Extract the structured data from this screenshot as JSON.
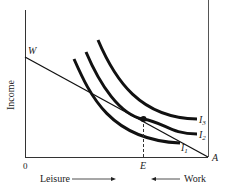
{
  "diagram": {
    "type": "indifference-curves",
    "y_axis_label": "Income",
    "origin_label": "0",
    "budget_intercept_label": "W",
    "right_corner_label": "A",
    "equilibrium_label": "E",
    "x_left_label": "Leisure",
    "x_right_label": "Work",
    "curves": [
      {
        "id": "I1",
        "label": "I",
        "sub": "1"
      },
      {
        "id": "I2",
        "label": "I",
        "sub": "2"
      },
      {
        "id": "I3",
        "label": "I",
        "sub": "3"
      }
    ],
    "colors": {
      "ink": "#111111",
      "axis": "#333333"
    }
  }
}
